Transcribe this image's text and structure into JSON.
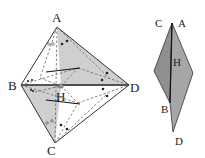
{
  "left_figure": {
    "vertices": {
      "A": {
        "label": "A",
        "x": 57,
        "y": 27
      },
      "B": {
        "label": "B",
        "x": 21,
        "y": 85
      },
      "C": {
        "label": "C",
        "x": 55,
        "y": 143
      },
      "D": {
        "label": "D",
        "x": 129,
        "y": 85
      },
      "H": {
        "label": "H",
        "x": 61,
        "y": 86
      }
    },
    "label_positions": {
      "A": {
        "x": 52,
        "y": 22
      },
      "B": {
        "x": 8,
        "y": 90
      },
      "C": {
        "x": 47,
        "y": 155
      },
      "D": {
        "x": 130,
        "y": 92
      },
      "H": {
        "x": 55,
        "y": 101
      }
    },
    "colors": {
      "shade": "#c8c8c8",
      "line": "#222222",
      "dash": "#555555"
    }
  },
  "right_figure": {
    "labels": {
      "CA": {
        "c": "C",
        "a": "A"
      },
      "H": "H",
      "B": "B",
      "D": "D"
    },
    "label_positions": {
      "C": {
        "x": 155,
        "y": 27
      },
      "A": {
        "x": 178,
        "y": 27
      },
      "H": {
        "x": 173,
        "y": 66
      },
      "B": {
        "x": 161,
        "y": 113
      },
      "D": {
        "x": 175,
        "y": 145
      }
    },
    "colors": {
      "fill": "#9a9a9a",
      "line": "#222222"
    }
  }
}
